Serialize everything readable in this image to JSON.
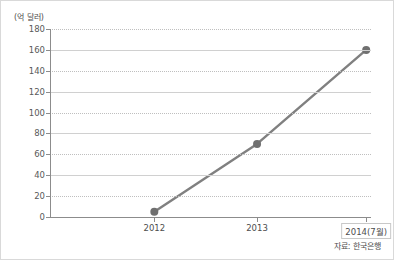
{
  "chart_data": {
    "type": "line",
    "title": "",
    "subtitle": "",
    "xlabel": "(년)",
    "ylabel": "(억 달러)",
    "categories": [
      "2012",
      "2013",
      "2014(7월)"
    ],
    "values": [
      5,
      70,
      160
    ],
    "series": [
      {
        "name": "",
        "values": [
          5,
          70,
          160
        ]
      }
    ],
    "ylim": [
      0,
      180
    ],
    "yticks": [
      0,
      20,
      40,
      60,
      80,
      100,
      120,
      140,
      160,
      180
    ],
    "ytick_labels": [
      "0",
      "20",
      "40",
      "60",
      "80",
      "100",
      "120",
      "140",
      "160",
      "180"
    ],
    "xtick_labels": [
      "2012",
      "2013",
      "2014(7월)"
    ],
    "grid": "horizontal-dotted",
    "legend": "none",
    "annotations": [],
    "source_note": "자료: 한국은행",
    "colors": {
      "line": "#808080",
      "marker": "#707070",
      "grid": "#bfbfbf",
      "axis": "#8c8c8c",
      "text": "#4d4d4d",
      "background": "#ffffff",
      "border": "#d9d9d9"
    }
  },
  "axis": {
    "y_unit_label": "(억 달러)",
    "x_unit_label": "(년)"
  },
  "footer": {
    "source": "자료: 한국은행"
  }
}
